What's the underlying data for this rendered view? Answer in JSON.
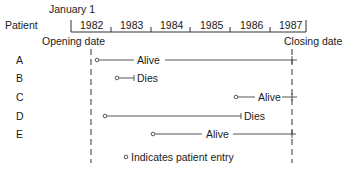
{
  "header": {
    "january_label": "January 1",
    "patient_label": "Patient",
    "years": [
      "1982",
      "1983",
      "1984",
      "1985",
      "1986",
      "1987"
    ],
    "opening_label": "Opening date",
    "closing_label": "Closing date"
  },
  "patients": [
    {
      "id": "A",
      "entry_year": 1982.1,
      "end_year": 1987.0,
      "outcome": "Alive"
    },
    {
      "id": "B",
      "entry_year": 1982.6,
      "end_year": 1983.1,
      "outcome": "Dies"
    },
    {
      "id": "C",
      "entry_year": 1985.8,
      "end_year": 1987.0,
      "outcome": "Alive"
    },
    {
      "id": "D",
      "entry_year": 1982.3,
      "end_year": 1986.3,
      "outcome": "Dies"
    },
    {
      "id": "E",
      "entry_year": 1983.9,
      "end_year": 1987.0,
      "outcome": "Alive"
    }
  ],
  "legend": {
    "text": "Indicates patient entry"
  },
  "colors": {
    "ink": "#1a1a1a",
    "line": "#555555"
  }
}
